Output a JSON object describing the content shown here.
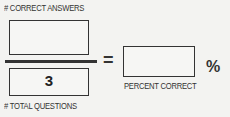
{
  "worksheet": {
    "numerator": {
      "label": "# CORRECT ANSWERS",
      "value": ""
    },
    "denominator": {
      "label": "# TOTAL QUESTIONS",
      "value": "3"
    },
    "equals_symbol": "=",
    "result": {
      "label": "PERCENT CORRECT",
      "value": "",
      "unit": "%"
    }
  }
}
